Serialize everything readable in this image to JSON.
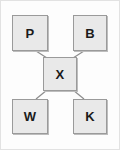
{
  "diagram": {
    "background_color": "#fdfdfd",
    "frame_color": "#e2e2e2",
    "node_fill": "#e9e9e9",
    "node_border": "#9a9a9a",
    "edge_color": "#8c8c8c",
    "label_color": "#1b1b1b",
    "nodes": [
      {
        "id": "p",
        "label": "P",
        "x": 12,
        "y": 15,
        "w": 36,
        "h": 36,
        "position": "top-left"
      },
      {
        "id": "b",
        "label": "B",
        "x": 73,
        "y": 15,
        "w": 34,
        "h": 36,
        "position": "top-right"
      },
      {
        "id": "x",
        "label": "X",
        "x": 43,
        "y": 57,
        "w": 34,
        "h": 34,
        "position": "center"
      },
      {
        "id": "w",
        "label": "W",
        "x": 12,
        "y": 99,
        "w": 36,
        "h": 35,
        "position": "bottom-left"
      },
      {
        "id": "k",
        "label": "K",
        "x": 73,
        "y": 99,
        "w": 34,
        "h": 35,
        "position": "bottom-right"
      }
    ],
    "edges": [
      {
        "id": "edge-x-p",
        "from": "x",
        "to": "p",
        "x1": 47,
        "y1": 58,
        "x2": 36,
        "y2": 51
      },
      {
        "id": "edge-x-b",
        "from": "x",
        "to": "b",
        "x1": 73,
        "y1": 58,
        "x2": 84,
        "y2": 51
      },
      {
        "id": "edge-x-w",
        "from": "x",
        "to": "w",
        "x1": 47,
        "y1": 90,
        "x2": 36,
        "y2": 99
      },
      {
        "id": "edge-x-k",
        "from": "x",
        "to": "k",
        "x1": 73,
        "y1": 90,
        "x2": 84,
        "y2": 99
      }
    ]
  }
}
